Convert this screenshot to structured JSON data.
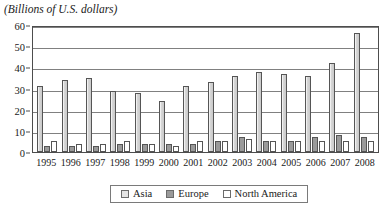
{
  "chart_data": {
    "type": "bar",
    "title": "(Billions of U.S. dollars)",
    "xlabel": "",
    "ylabel": "",
    "ylim": [
      0,
      60
    ],
    "yticks": [
      0,
      10,
      20,
      30,
      40,
      50,
      60
    ],
    "grid": true,
    "legend_position": "bottom",
    "categories": [
      "1995",
      "1996",
      "1997",
      "1998",
      "1999",
      "2000",
      "2001",
      "2002",
      "2003",
      "2004",
      "2005",
      "2006",
      "2007",
      "2008"
    ],
    "series": [
      {
        "name": "Asia",
        "color": "#d6d6d6",
        "values": [
          31,
          34,
          35,
          29,
          28,
          24,
          31,
          33,
          36,
          38,
          37,
          36,
          42,
          56
        ]
      },
      {
        "name": "Europe",
        "color": "#9a9a9a",
        "values": [
          3,
          3,
          3,
          4,
          4,
          4,
          4,
          5,
          7,
          5,
          5,
          7,
          8,
          7
        ]
      },
      {
        "name": "North America",
        "color": "#ffffff",
        "values": [
          5,
          4,
          4,
          5,
          4,
          3,
          5,
          5,
          6,
          5,
          5,
          5,
          5,
          5
        ]
      }
    ]
  },
  "legend": {
    "items": [
      {
        "label": "Asia",
        "swatch": "asia"
      },
      {
        "label": "Europe",
        "swatch": "europe"
      },
      {
        "label": "North America",
        "swatch": "northamerica"
      }
    ]
  }
}
